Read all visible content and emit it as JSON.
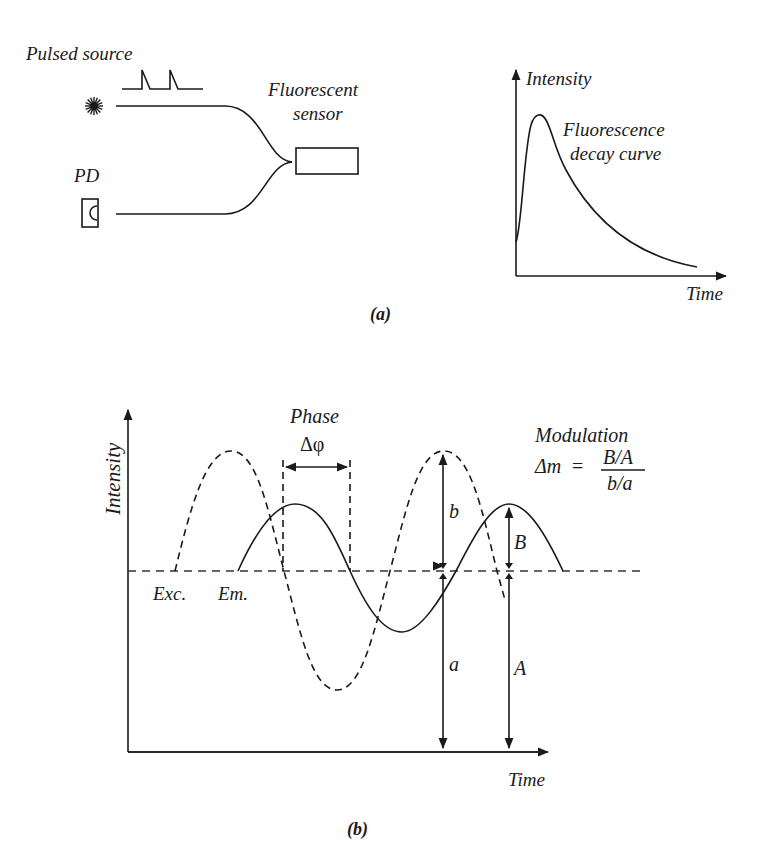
{
  "panel_a": {
    "caption": "(a)",
    "setup": {
      "source_label": "Pulsed source",
      "detector_label": "PD",
      "sensor_label_line1": "Fluorescent",
      "sensor_label_line2": "sensor",
      "icons": [
        "light-source-icon",
        "photodiode-icon",
        "pulse-train-icon"
      ]
    },
    "decay_plot": {
      "y_axis_label": "Intensity",
      "x_axis_label": "Time",
      "curve_label_line1": "Fluorescence",
      "curve_label_line2": "decay curve"
    }
  },
  "panel_b": {
    "caption": "(b)",
    "y_axis_label": "Intensity",
    "x_axis_label": "Time",
    "phase_label": "Phase",
    "phase_symbol": "Δφ",
    "excitation_label": "Exc.",
    "emission_label": "Em.",
    "modulation_title": "Modulation",
    "modulation_lhs": "Δm",
    "modulation_eq": "=",
    "modulation_num": "B/A",
    "modulation_den": "b/a",
    "amp_labels": {
      "b": "b",
      "a": "a",
      "B": "B",
      "A": "A"
    }
  }
}
